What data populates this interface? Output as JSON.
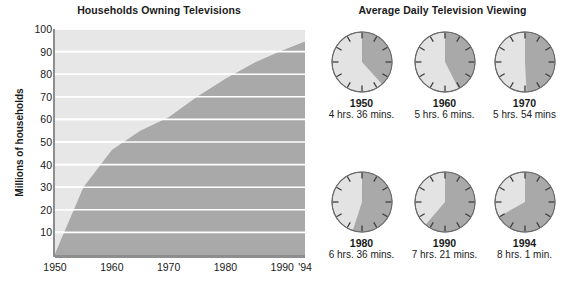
{
  "chart_data": [
    {
      "type": "area",
      "title": "Households Owning Televisions",
      "xlabel": "",
      "ylabel": "Millions of households",
      "xlim": [
        1950,
        1994
      ],
      "ylim": [
        0,
        100
      ],
      "grid": true,
      "legend": "none",
      "xtick_labels": [
        "1950",
        "1960",
        "1970",
        "1980",
        "1990",
        "'94"
      ],
      "xtick_values": [
        1950,
        1960,
        1970,
        1980,
        1990,
        1994
      ],
      "ytick_labels": [
        "10",
        "20",
        "30",
        "40",
        "50",
        "60",
        "70",
        "80",
        "90",
        "100"
      ],
      "ytick_values": [
        10,
        20,
        30,
        40,
        50,
        60,
        70,
        80,
        90,
        100
      ],
      "x": [
        1950,
        1955,
        1960,
        1965,
        1970,
        1975,
        1980,
        1985,
        1990,
        1994
      ],
      "values": [
        0.5,
        30,
        46.5,
        55,
        61,
        70,
        78,
        85,
        90.5,
        94.5
      ],
      "series": [
        {
          "name": "Households owning televisions",
          "values": [
            0.5,
            30,
            46.5,
            55,
            61,
            70,
            78,
            85,
            90.5,
            94.5
          ]
        }
      ],
      "area_color": "#a9a9a9",
      "plot_background": "#e7e7e7",
      "gridline_color": "#ffffff"
    },
    {
      "type": "pie",
      "title": "Average Daily Television Viewing",
      "note": "Six clock faces; shaded wedge starts at 12 o'clock and sweeps clockwise for the viewing duration.",
      "categories": [
        "1950",
        "1960",
        "1970",
        "1980",
        "1990",
        "1994"
      ],
      "values": [
        4.6,
        5.1,
        5.9,
        6.6,
        7.35,
        8.017
      ],
      "wedge_color": "#a9a9a9",
      "face_color": "#e3e3e3"
    }
  ],
  "chart": {
    "title": "Households Owning Televisions",
    "ylabel": "Millions of households",
    "yticks": [
      "100",
      "90",
      "80",
      "70",
      "60",
      "50",
      "40",
      "30",
      "20",
      "10"
    ],
    "xticks": [
      "1950",
      "1960",
      "1970",
      "1980",
      "1990",
      "'94"
    ]
  },
  "clocks": {
    "title": "Average Daily Television Viewing",
    "items": [
      {
        "year": "1950",
        "time": "4 hrs. 36 mins.",
        "hours": 4.6
      },
      {
        "year": "1960",
        "time": "5 hrs. 6 mins.",
        "hours": 5.1
      },
      {
        "year": "1970",
        "time": "5 hrs. 54 mins",
        "hours": 5.9
      },
      {
        "year": "1980",
        "time": "6 hrs. 36 mins.",
        "hours": 6.6
      },
      {
        "year": "1990",
        "time": "7 hrs. 21 mins.",
        "hours": 7.35
      },
      {
        "year": "1994",
        "time": "8 hrs. 1 min.",
        "hours": 8.0167
      }
    ]
  },
  "colors": {
    "area_fill": "#a9a9a9",
    "plot_bg": "#e7e7e7",
    "gridline": "#ffffff",
    "axis": "#8e8e8e",
    "clock_face": "#e3e3e3",
    "clock_wedge": "#a9a9a9",
    "clock_outline": "#6b6b6b",
    "text": "#1a1a1a"
  }
}
